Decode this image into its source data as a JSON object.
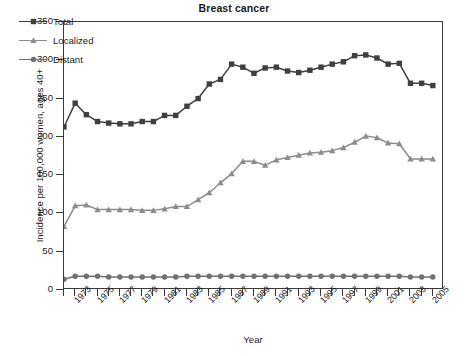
{
  "chart_data": {
    "type": "line",
    "title": "Breast cancer",
    "xlabel": "Year",
    "ylabel": "Incidence per 100,000 women, ages 40+",
    "xlim": [
      1972,
      2006
    ],
    "ylim": [
      0,
      350
    ],
    "ytick_step": 50,
    "yticks": [
      0,
      50,
      100,
      150,
      200,
      250,
      300,
      350
    ],
    "ytick_labels": [
      "0",
      "50",
      "100",
      "150",
      "200",
      "250",
      "300",
      "350"
    ],
    "x": [
      1972,
      1973,
      1974,
      1975,
      1976,
      1977,
      1978,
      1979,
      1980,
      1981,
      1982,
      1983,
      1984,
      1985,
      1986,
      1987,
      1988,
      1989,
      1990,
      1991,
      1992,
      1993,
      1994,
      1995,
      1996,
      1997,
      1998,
      1999,
      2000,
      2001,
      2002,
      2003,
      2004,
      2005
    ],
    "xtick_years": [
      1972,
      1973,
      1974,
      1975,
      1976,
      1977,
      1978,
      1979,
      1980,
      1981,
      1982,
      1983,
      1984,
      1985,
      1986,
      1987,
      1988,
      1989,
      1990,
      1991,
      1992,
      1993,
      1994,
      1995,
      1996,
      1997,
      1998,
      1999,
      2000,
      2001,
      2002,
      2003,
      2004,
      2005
    ],
    "xtick_labels_shown": [
      "1973",
      "1975",
      "1977",
      "1979",
      "1981",
      "1983",
      "1985",
      "1987",
      "1989",
      "1991",
      "1993",
      "1995",
      "1997",
      "1999",
      "2001",
      "2003",
      "2005"
    ],
    "grid": false,
    "legend_position": "upper left",
    "series": [
      {
        "name": "Total",
        "color": "#3f3f3f",
        "marker": "square",
        "values": [
          213,
          244,
          229,
          220,
          218,
          217,
          217,
          220,
          220,
          228,
          228,
          240,
          250,
          269,
          275,
          295,
          291,
          283,
          290,
          291,
          286,
          284,
          287,
          291,
          295,
          298,
          306,
          307,
          303,
          295,
          296,
          270,
          270,
          267
        ]
      },
      {
        "name": "Localized",
        "color": "#8c8c8c",
        "marker": "triangle",
        "values": [
          83,
          110,
          111,
          105,
          105,
          105,
          105,
          104,
          104,
          106,
          109,
          109,
          118,
          127,
          140,
          152,
          168,
          168,
          163,
          170,
          173,
          176,
          179,
          180,
          182,
          186,
          193,
          201,
          199,
          192,
          191,
          171,
          171,
          171
        ]
      },
      {
        "name": "Distant",
        "color": "#707070",
        "marker": "circle",
        "values": [
          14,
          18,
          18,
          18,
          17,
          17,
          17,
          17,
          17,
          17,
          17,
          18,
          18,
          18,
          18,
          18,
          18,
          18,
          18,
          18,
          18,
          18,
          18,
          18,
          18,
          18,
          18,
          18,
          18,
          18,
          18,
          17,
          17,
          17
        ]
      }
    ]
  },
  "legend": {
    "items": [
      {
        "label": "Total"
      },
      {
        "label": "Localized"
      },
      {
        "label": "Distant"
      }
    ]
  }
}
